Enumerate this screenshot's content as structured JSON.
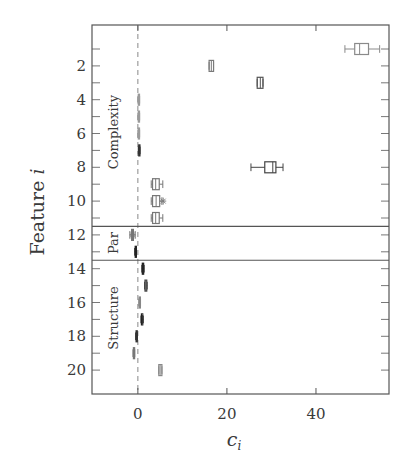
{
  "chart_data": {
    "type": "boxplot",
    "orientation": "horizontal",
    "title": "",
    "xlabel": "c_i",
    "ylabel": "Feature i",
    "xlim": [
      -10.3,
      56.4
    ],
    "ylim": [
      21.2,
      0
    ],
    "xticks": [
      0,
      20,
      40
    ],
    "yticks": [
      2,
      4,
      6,
      8,
      10,
      12,
      14,
      16,
      18,
      20
    ],
    "grid": false,
    "reference_line": {
      "x": 0,
      "style": "dashed"
    },
    "groups": [
      {
        "name": "Complexity",
        "features": [
          1,
          11
        ],
        "separator_after": 11.5
      },
      {
        "name": "Par",
        "features": [
          12,
          13
        ],
        "separator_after": 13.5
      },
      {
        "name": "Structure",
        "features": [
          14,
          20
        ]
      }
    ],
    "boxes": [
      {
        "feature": 1,
        "whisker_low": 46.5,
        "q1": 48.7,
        "median": 49.8,
        "q3": 51.8,
        "whisker_high": 54.3,
        "shade": "#8a8a8a"
      },
      {
        "feature": 2,
        "whisker_low": 16.0,
        "q1": 16.0,
        "median": 16.5,
        "q3": 17.0,
        "whisker_high": 17.0,
        "shade": "#7a7a7a"
      },
      {
        "feature": 3,
        "whisker_low": 26.8,
        "q1": 26.8,
        "median": 27.5,
        "q3": 28.1,
        "whisker_high": 28.1,
        "shade": "#555555"
      },
      {
        "feature": 4,
        "whisker_low": 0.0,
        "q1": 0.1,
        "median": 0.2,
        "q3": 0.3,
        "whisker_high": 0.4,
        "shade": "#9a9a9a"
      },
      {
        "feature": 5,
        "whisker_low": 0.0,
        "q1": 0.1,
        "median": 0.2,
        "q3": 0.3,
        "whisker_high": 0.4,
        "shade": "#9a9a9a"
      },
      {
        "feature": 6,
        "whisker_low": 0.0,
        "q1": 0.1,
        "median": 0.2,
        "q3": 0.3,
        "whisker_high": 0.4,
        "shade": "#9a9a9a"
      },
      {
        "feature": 7,
        "whisker_low": 0.1,
        "q1": 0.2,
        "median": 0.3,
        "q3": 0.4,
        "whisker_high": 0.5,
        "shade": "#333333"
      },
      {
        "feature": 8,
        "whisker_low": 25.4,
        "q1": 28.5,
        "median": 30.3,
        "q3": 31.0,
        "whisker_high": 32.6,
        "shade": "#444444"
      },
      {
        "feature": 9,
        "whisker_low": 3.0,
        "q1": 3.3,
        "median": 4.0,
        "q3": 4.8,
        "whisker_high": 5.6,
        "shade": "#777777"
      },
      {
        "feature": 10,
        "whisker_low": 3.0,
        "q1": 3.3,
        "median": 4.1,
        "q3": 4.9,
        "whisker_high": 5.4,
        "shade": "#777777",
        "outlier": 5.7
      },
      {
        "feature": 11,
        "whisker_low": 3.0,
        "q1": 3.3,
        "median": 4.0,
        "q3": 4.8,
        "whisker_high": 5.6,
        "shade": "#777777"
      },
      {
        "feature": 12,
        "whisker_low": -1.8,
        "q1": -1.4,
        "median": -1.2,
        "q3": -1.0,
        "whisker_high": -0.6,
        "shade": "#777777",
        "outlier": -1.2
      },
      {
        "feature": 13,
        "whisker_low": -0.7,
        "q1": -0.6,
        "median": -0.5,
        "q3": -0.4,
        "whisker_high": -0.3,
        "shade": "#222222"
      },
      {
        "feature": 14,
        "whisker_low": 0.9,
        "q1": 1.0,
        "median": 1.1,
        "q3": 1.3,
        "whisker_high": 1.4,
        "shade": "#222222"
      },
      {
        "feature": 15,
        "whisker_low": 1.5,
        "q1": 1.6,
        "median": 1.8,
        "q3": 2.0,
        "whisker_high": 2.1,
        "shade": "#444444"
      },
      {
        "feature": 16,
        "whisker_low": 0.2,
        "q1": 0.3,
        "median": 0.4,
        "q3": 0.5,
        "whisker_high": 0.6,
        "shade": "#888888"
      },
      {
        "feature": 17,
        "whisker_low": 0.7,
        "q1": 0.8,
        "median": 0.9,
        "q3": 1.1,
        "whisker_high": 1.2,
        "shade": "#222222"
      },
      {
        "feature": 18,
        "whisker_low": -0.5,
        "q1": -0.4,
        "median": -0.3,
        "q3": -0.2,
        "whisker_high": -0.1,
        "shade": "#333333"
      },
      {
        "feature": 19,
        "whisker_low": -1.1,
        "q1": -1.0,
        "median": -0.9,
        "q3": -0.8,
        "whisker_high": -0.7,
        "shade": "#777777"
      },
      {
        "feature": 20,
        "whisker_low": 4.7,
        "q1": 4.7,
        "median": 5.0,
        "q3": 5.4,
        "whisker_high": 5.4,
        "shade": "#888888"
      }
    ]
  },
  "labels": {
    "xlabel_main": "c",
    "xlabel_sub": "i",
    "ylabel_main": "Feature ",
    "ylabel_var": "i",
    "group_complexity": "Complexity",
    "group_par": "Par",
    "group_structure": "Structure"
  },
  "colors": {
    "frame": "#555555",
    "text": "#3a3a3a",
    "dashed_line": "#888888",
    "background": "#ffffff"
  }
}
